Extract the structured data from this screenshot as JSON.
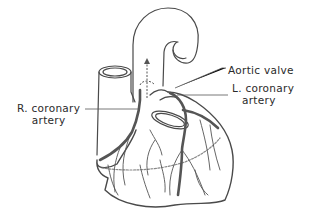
{
  "diagram": {
    "type": "anatomical-illustration",
    "labels": {
      "aortic_valve": "Aortic valve",
      "l_coronary_line1": "L. coronary",
      "l_coronary_line2": "artery",
      "r_coronary_line1": "R. coronary",
      "r_coronary_line2": "artery"
    },
    "colors": {
      "outline": "#4a4a4a",
      "artery": "#555555",
      "background": "#ffffff",
      "text": "#2a2a2a"
    }
  }
}
